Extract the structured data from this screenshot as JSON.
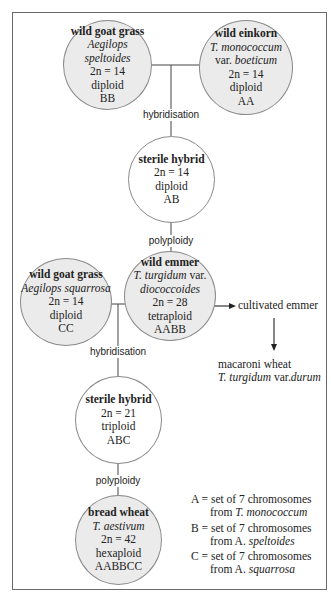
{
  "nodes": {
    "goat_grass_1": {
      "name": "wild goat grass",
      "species": "Aegilops speltoides",
      "chromosomes": "2n = 14",
      "ploidy": "diploid",
      "genome": "BB"
    },
    "einkorn": {
      "name": "wild einkorn",
      "species": "T. monococcum",
      "variety_prefix": "var. ",
      "variety": "boeticum",
      "chromosomes": "2n = 14",
      "ploidy": "diploid",
      "genome": "AA"
    },
    "sterile_hybrid_1": {
      "name": "sterile hybrid",
      "chromosomes": "2n = 14",
      "ploidy": "diploid",
      "genome": "AB"
    },
    "goat_grass_2": {
      "name": "wild goat grass",
      "species": "Aegilops squarrosa",
      "chromosomes": "2n = 14",
      "ploidy": "diploid",
      "genome": "CC"
    },
    "wild_emmer": {
      "name": "wild emmer",
      "species": "T. turgidum",
      "species_suffix": " var.",
      "variety": "diococcoides",
      "chromosomes": "2n = 28",
      "ploidy": "tetraploid",
      "genome": "AABB"
    },
    "sterile_hybrid_2": {
      "name": "sterile hybrid",
      "chromosomes": "2n = 21",
      "ploidy": "triploid",
      "genome": "ABC"
    },
    "bread_wheat": {
      "name": "bread wheat",
      "species": "T. aestivum",
      "chromosomes": "2n = 42",
      "ploidy": "hexaploid",
      "genome": "AABBCC"
    }
  },
  "processes": {
    "hybridisation_1": "hybridisation",
    "polyploidy_1": "polyploidy",
    "hybridisation_2": "hybridisation",
    "polyploidy_2": "polyploidy"
  },
  "side_branch": {
    "cultivated": "cultivated emmer",
    "macaroni_name": "macaroni wheat",
    "macaroni_species": "T. turgidum",
    "macaroni_var": " var.",
    "macaroni_variety": "durum"
  },
  "legend": [
    {
      "line1": "A = set of 7 chromosomes",
      "from": "from ",
      "source": "T. monococcum"
    },
    {
      "line1": "B = set of 7 chromosomes",
      "from": "from A. ",
      "source": "speltoides"
    },
    {
      "line1": "C = set of 7 chromosomes",
      "from": "from A. ",
      "source": "squarrosa"
    }
  ],
  "colors": {
    "gray_fill": "#ebebeb",
    "line": "#444444",
    "border": "#6a6a6a"
  }
}
